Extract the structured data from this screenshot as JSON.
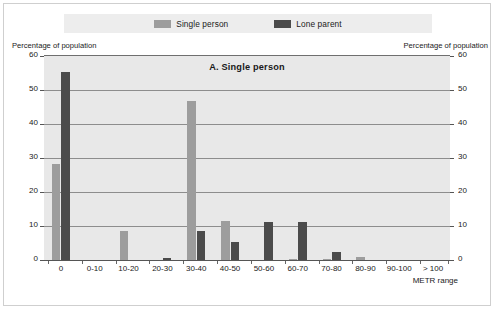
{
  "legend": {
    "items": [
      {
        "label": "Single person",
        "color": "#9d9d9d",
        "icon": "legend-swatch-single-person"
      },
      {
        "label": "Lone parent",
        "color": "#4b4b4b",
        "icon": "legend-swatch-lone-parent"
      }
    ]
  },
  "axis_captions": {
    "left": "Percentage of population",
    "right": "Percentage of population"
  },
  "chart_data": {
    "type": "bar",
    "title": "A.  Single person",
    "xlabel": "METR range",
    "ylabel": "Percentage of population",
    "ylim": [
      0,
      60
    ],
    "yticks": [
      0,
      10,
      20,
      30,
      40,
      50,
      60
    ],
    "grid": true,
    "legend_position": "top-center",
    "categories": [
      "0",
      "0-10",
      "10-20",
      "20-30",
      "30-40",
      "40-50",
      "50-60",
      "60-70",
      "70-80",
      "80-90",
      "90-100",
      "> 100"
    ],
    "series": [
      {
        "name": "Single person",
        "color": "#9d9d9d",
        "values": [
          28.5,
          0.3,
          8.7,
          0.3,
          47.0,
          11.7,
          0.4,
          0.6,
          0.5,
          1.2,
          0.2,
          0.0
        ]
      },
      {
        "name": "Lone parent",
        "color": "#4b4b4b",
        "values": [
          55.5,
          0.0,
          0.0,
          1.0,
          8.8,
          5.6,
          11.6,
          11.6,
          2.7,
          0.3,
          0.0,
          0.0
        ]
      }
    ]
  }
}
